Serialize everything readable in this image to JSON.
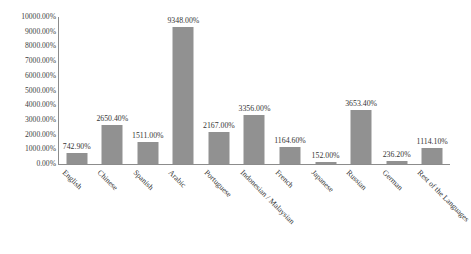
{
  "chart_data": {
    "type": "bar",
    "title": "",
    "subtitle": "",
    "xlabel": "",
    "ylabel": "",
    "ylim": [
      0,
      10000
    ],
    "grid": false,
    "legend": false,
    "value_suffix": "%",
    "categories": [
      "English",
      "Chinese",
      "Spanish",
      "Arabic",
      "Portuguese",
      "Indonesian / Malaysian",
      "French",
      "Japanese",
      "Russian",
      "German",
      "Rest of the Languages"
    ],
    "values": [
      742.9,
      2650.4,
      1511.0,
      9348.0,
      2167.0,
      3356.0,
      1164.6,
      152.0,
      3653.4,
      236.2,
      1114.1
    ],
    "data_labels": [
      "742.90%",
      "2650.40%",
      "1511.00%",
      "9348.00%",
      "2167.00%",
      "3356.00%",
      "1164.60%",
      "152.00%",
      "3653.40%",
      "236.20%",
      "1114.10%"
    ],
    "y_ticks": [
      10000,
      9000,
      8000,
      7000,
      6000,
      5000,
      4000,
      3000,
      2000,
      1000,
      0
    ],
    "y_tick_labels": [
      "10000.00%",
      "9000.00%",
      "8000.00%",
      "7000.00%",
      "6000.00%",
      "5000.00%",
      "4000.00%",
      "3000.00%",
      "2000.00%",
      "1000.00%",
      "0.00%"
    ],
    "series_color": "#919191",
    "axis_color": "#8c8c8c",
    "text_color": "#353535",
    "background": "#ffffff"
  }
}
